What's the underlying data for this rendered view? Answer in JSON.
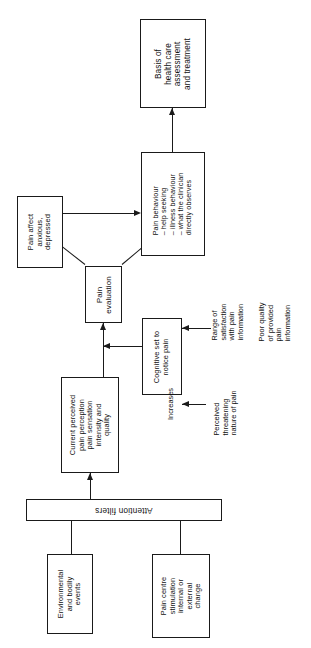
{
  "figure": {
    "orientation": "landscape content rotated on portrait page",
    "ink_color": "#1a1a1a",
    "background_color": "#ffffff"
  },
  "nodes": {
    "basis": {
      "id": "basis-of-health-care",
      "lines": [
        "Basis of",
        "health care",
        "assessment",
        "and treatment"
      ],
      "text": "Basis of health care assessment and treatment"
    },
    "pain_behaviour": {
      "id": "pain-behaviour",
      "lines": [
        "Pain behaviour",
        "– help seeking",
        "– illness behaviour",
        "– what the clinician",
        "   directly observes"
      ],
      "text": "Pain behaviour - help seeking - illness behaviour - what the clinician directly observes"
    },
    "pain_affect": {
      "id": "pain-affect",
      "lines": [
        "Pain affect",
        "anxious,",
        "depressed"
      ],
      "text": "Pain affect anxious, depressed"
    },
    "pain_evaluation": {
      "id": "pain-evaluation",
      "lines": [
        "Pain",
        "evaluation"
      ],
      "text": "Pain evaluation"
    },
    "cognitive_set": {
      "id": "cognitive-set-to-notice-pain",
      "lines": [
        "Cognitive set to",
        "notice pain"
      ],
      "text": "Cognitive set to notice pain"
    },
    "current_perceived": {
      "id": "current-perceived-pain-perception",
      "lines": [
        "Current perceived",
        "pain perception",
        "pain sensation",
        "intensity and",
        "quality"
      ],
      "text": "Current perceived pain perception pain sensation intensity and quality"
    },
    "attention_filters": {
      "id": "attention-filters",
      "text": "Attention filters"
    },
    "environmental": {
      "id": "environmental-and-bodily-events",
      "lines": [
        "Environmental",
        "and bodily",
        "events"
      ],
      "text": "Environmental and bodily events"
    },
    "pain_centre": {
      "id": "pain-centre-stimulation",
      "lines": [
        "Pain centre",
        "stimulation",
        "internal or",
        "external",
        "change"
      ],
      "text": "Pain centre stimulation internal or external change"
    }
  },
  "annotations": {
    "increases": {
      "id": "increases",
      "text": "Increases"
    },
    "range_of_satisfaction": {
      "id": "range-of-satisfaction",
      "lines": [
        "Range of",
        "satisfaction",
        "with pain",
        "information"
      ],
      "text": "Range of satisfaction with pain information"
    },
    "poor_quality": {
      "id": "poor-quality-of-provided-pain-information",
      "lines": [
        "Poor quality",
        "of provided",
        "pain",
        "information"
      ],
      "text": "Poor quality of provided pain information"
    },
    "perceived_threatening": {
      "id": "perceived-threatening-nature-of-pain",
      "lines": [
        "Perceived",
        "threatening",
        "nature of pain"
      ],
      "text": "Perceived threatening nature of pain"
    }
  }
}
